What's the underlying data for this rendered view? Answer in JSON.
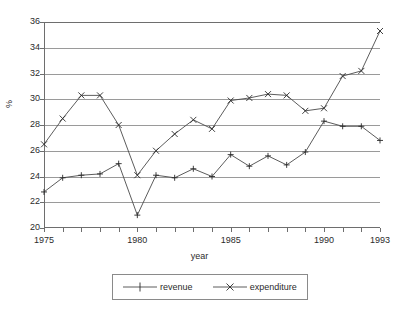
{
  "chart_data": {
    "type": "line",
    "title": "",
    "xlabel": "year",
    "ylabel": "%",
    "xlim": [
      1975,
      1993
    ],
    "ylim": [
      20,
      36
    ],
    "grid": true,
    "legend_position": "bottom",
    "x": [
      1975,
      1976,
      1977,
      1978,
      1979,
      1980,
      1981,
      1982,
      1983,
      1984,
      1985,
      1986,
      1987,
      1988,
      1989,
      1990,
      1991,
      1992,
      1993
    ],
    "x_tick_labels": [
      "1975",
      "1980",
      "1985",
      "1990",
      "1993"
    ],
    "x_tick_values": [
      1975,
      1980,
      1985,
      1990,
      1993
    ],
    "y_tick_labels": [
      "20",
      "22",
      "24",
      "26",
      "28",
      "30",
      "32",
      "34",
      "36"
    ],
    "y_tick_values": [
      20,
      22,
      24,
      26,
      28,
      30,
      32,
      34,
      36
    ],
    "series": [
      {
        "name": "revenue",
        "marker": "plus",
        "values": [
          22.8,
          23.9,
          24.1,
          24.2,
          25.0,
          21.0,
          24.1,
          23.9,
          24.6,
          24.0,
          25.7,
          24.8,
          25.6,
          24.9,
          25.9,
          28.3,
          27.9,
          27.9,
          26.8
        ]
      },
      {
        "name": "expenditure",
        "marker": "cross",
        "values": [
          26.5,
          28.5,
          30.3,
          30.3,
          28.0,
          24.1,
          26.0,
          27.3,
          28.4,
          27.7,
          29.9,
          30.1,
          30.4,
          30.3,
          29.1,
          29.3,
          31.8,
          32.2,
          35.3
        ]
      }
    ]
  },
  "legend": {
    "entries": [
      {
        "label": "revenue",
        "marker": "plus-marker"
      },
      {
        "label": "expenditure",
        "marker": "cross-marker"
      }
    ]
  },
  "axes": {
    "x_title": "year",
    "y_title": "%"
  }
}
